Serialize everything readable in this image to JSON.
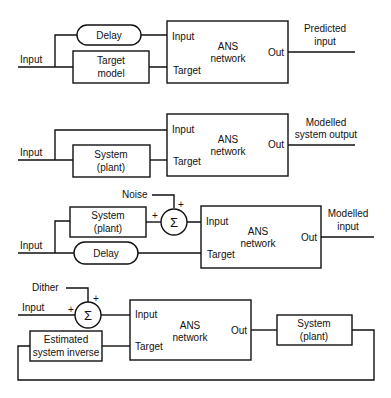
{
  "diagrams": [
    {
      "name": "prediction",
      "input_label": "Input",
      "top_block": "Delay",
      "bottom_block": [
        "Target",
        "model"
      ],
      "ans": {
        "input": "Input",
        "target": "Target",
        "title": [
          "ANS",
          "network"
        ],
        "out": "Out"
      },
      "output_label": [
        "Predicted",
        "input"
      ]
    },
    {
      "name": "system-identification",
      "input_label": "Input",
      "bottom_block": [
        "System",
        "(plant)"
      ],
      "ans": {
        "input": "Input",
        "target": "Target",
        "title": [
          "ANS",
          "network"
        ],
        "out": "Out"
      },
      "output_label": [
        "Modelled",
        "system output"
      ]
    },
    {
      "name": "noise-cancellation",
      "input_label": "Input",
      "noise_label": "Noise",
      "top_block": [
        "System",
        "(plant)"
      ],
      "bottom_block": "Delay",
      "sum_symbol": "Σ",
      "plus": "+",
      "ans": {
        "input": "Input",
        "target": "Target",
        "title": [
          "ANS",
          "network"
        ],
        "out": "Out"
      },
      "output_label": [
        "Modelled",
        "input"
      ]
    },
    {
      "name": "inverse-modelling",
      "input_label": "Input",
      "dither_label": "Dither",
      "sum_symbol": "Σ",
      "plus": "+",
      "estimator_block": [
        "Estimated",
        "system inverse"
      ],
      "plant_block": [
        "System",
        "(plant)"
      ],
      "ans": {
        "input": "Input",
        "target": "Target",
        "title": [
          "ANS",
          "network"
        ],
        "out": "Out"
      }
    }
  ]
}
